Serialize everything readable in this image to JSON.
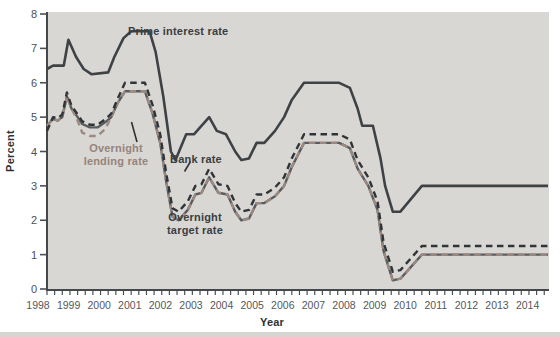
{
  "chart_data": {
    "type": "line",
    "title": "",
    "xlabel": "Year",
    "ylabel": "Percent",
    "xlim": [
      1998,
      2014.4
    ],
    "ylim": [
      0,
      8
    ],
    "y_ticks": [
      0,
      1,
      2,
      3,
      4,
      5,
      6,
      7,
      8
    ],
    "x_ticks": [
      1998,
      1999,
      2000,
      2001,
      2002,
      2003,
      2004,
      2005,
      2006,
      2007,
      2008,
      2009,
      2010,
      2011,
      2012,
      2013,
      2014
    ],
    "x_minor_tick_interval": 0.25,
    "grid": false,
    "legend": "inline-annotations",
    "plot_background": "#d8d7d4",
    "axis_color": "#45484b",
    "series": [
      {
        "name": "Prime interest rate",
        "style": "solid",
        "color": "#3e4245",
        "points": [
          [
            1998.0,
            6.4
          ],
          [
            1998.2,
            6.5
          ],
          [
            1998.55,
            6.5
          ],
          [
            1998.7,
            7.25
          ],
          [
            1998.95,
            6.75
          ],
          [
            1999.2,
            6.4
          ],
          [
            1999.45,
            6.25
          ],
          [
            2000.0,
            6.3
          ],
          [
            2000.2,
            6.75
          ],
          [
            2000.5,
            7.3
          ],
          [
            2000.75,
            7.5
          ],
          [
            2001.35,
            7.5
          ],
          [
            2001.55,
            6.9
          ],
          [
            2001.8,
            5.6
          ],
          [
            2002.05,
            4.0
          ],
          [
            2002.2,
            3.75
          ],
          [
            2002.55,
            4.5
          ],
          [
            2002.8,
            4.5
          ],
          [
            2003.3,
            5.0
          ],
          [
            2003.55,
            4.6
          ],
          [
            2003.85,
            4.5
          ],
          [
            2004.15,
            4.0
          ],
          [
            2004.35,
            3.75
          ],
          [
            2004.6,
            3.8
          ],
          [
            2004.85,
            4.25
          ],
          [
            2005.1,
            4.25
          ],
          [
            2005.45,
            4.6
          ],
          [
            2005.75,
            5.0
          ],
          [
            2006.0,
            5.5
          ],
          [
            2006.4,
            6.0
          ],
          [
            2007.55,
            6.0
          ],
          [
            2007.9,
            5.85
          ],
          [
            2008.15,
            5.25
          ],
          [
            2008.3,
            4.75
          ],
          [
            2008.65,
            4.75
          ],
          [
            2008.9,
            3.8
          ],
          [
            2009.05,
            3.0
          ],
          [
            2009.3,
            2.25
          ],
          [
            2009.55,
            2.25
          ],
          [
            2010.25,
            3.0
          ],
          [
            2014.0,
            3.0
          ]
        ]
      },
      {
        "name": "Bank rate",
        "style": "dashed",
        "color": "#303438",
        "points": [
          [
            1998.0,
            4.6
          ],
          [
            1998.2,
            5.0
          ],
          [
            1998.35,
            4.97
          ],
          [
            1998.5,
            5.08
          ],
          [
            1998.65,
            5.72
          ],
          [
            1998.8,
            5.33
          ],
          [
            1999.0,
            5.08
          ],
          [
            1999.15,
            4.88
          ],
          [
            1999.4,
            4.78
          ],
          [
            1999.65,
            4.78
          ],
          [
            1999.9,
            4.93
          ],
          [
            2000.1,
            5.1
          ],
          [
            2000.3,
            5.52
          ],
          [
            2000.55,
            6.0
          ],
          [
            2001.2,
            6.0
          ],
          [
            2001.45,
            5.35
          ],
          [
            2001.7,
            4.5
          ],
          [
            2001.9,
            3.35
          ],
          [
            2002.1,
            2.35
          ],
          [
            2002.3,
            2.25
          ],
          [
            2002.6,
            2.55
          ],
          [
            2002.85,
            3.0
          ],
          [
            2003.05,
            3.05
          ],
          [
            2003.3,
            3.5
          ],
          [
            2003.6,
            3.05
          ],
          [
            2003.9,
            3.0
          ],
          [
            2004.15,
            2.5
          ],
          [
            2004.35,
            2.25
          ],
          [
            2004.6,
            2.3
          ],
          [
            2004.85,
            2.75
          ],
          [
            2005.1,
            2.75
          ],
          [
            2005.45,
            2.95
          ],
          [
            2005.75,
            3.25
          ],
          [
            2006.0,
            3.8
          ],
          [
            2006.4,
            4.5
          ],
          [
            2007.55,
            4.5
          ],
          [
            2007.9,
            4.35
          ],
          [
            2008.15,
            3.75
          ],
          [
            2008.5,
            3.25
          ],
          [
            2008.8,
            2.55
          ],
          [
            2009.0,
            1.35
          ],
          [
            2009.3,
            0.5
          ],
          [
            2009.55,
            0.55
          ],
          [
            2010.25,
            1.25
          ],
          [
            2014.0,
            1.25
          ]
        ]
      },
      {
        "name": "Overnight lending rate",
        "style": "dashed",
        "color": "#9c8a80",
        "points": [
          [
            1998.0,
            4.75
          ],
          [
            1998.2,
            4.95
          ],
          [
            1998.35,
            4.9
          ],
          [
            1998.5,
            5.0
          ],
          [
            1998.65,
            5.6
          ],
          [
            1998.8,
            5.25
          ],
          [
            1999.0,
            4.9
          ],
          [
            1999.15,
            4.55
          ],
          [
            1999.4,
            4.45
          ],
          [
            1999.65,
            4.45
          ],
          [
            1999.9,
            4.65
          ],
          [
            2000.1,
            5.0
          ],
          [
            2000.3,
            5.4
          ],
          [
            2000.55,
            5.75
          ],
          [
            2001.2,
            5.75
          ],
          [
            2001.45,
            5.1
          ],
          [
            2001.7,
            4.25
          ],
          [
            2001.9,
            3.1
          ],
          [
            2002.1,
            2.1
          ],
          [
            2002.3,
            2.0
          ],
          [
            2002.6,
            2.3
          ],
          [
            2002.85,
            2.75
          ],
          [
            2003.05,
            2.8
          ],
          [
            2003.3,
            3.25
          ],
          [
            2003.6,
            2.8
          ],
          [
            2003.9,
            2.75
          ],
          [
            2004.15,
            2.25
          ],
          [
            2004.35,
            2.0
          ],
          [
            2004.6,
            2.05
          ],
          [
            2004.85,
            2.5
          ],
          [
            2005.1,
            2.5
          ],
          [
            2005.45,
            2.7
          ],
          [
            2005.75,
            3.0
          ],
          [
            2006.0,
            3.55
          ],
          [
            2006.4,
            4.25
          ],
          [
            2007.55,
            4.25
          ],
          [
            2007.9,
            4.1
          ],
          [
            2008.15,
            3.5
          ],
          [
            2008.5,
            3.0
          ],
          [
            2008.8,
            2.3
          ],
          [
            2009.0,
            1.1
          ],
          [
            2009.3,
            0.25
          ],
          [
            2009.55,
            0.3
          ],
          [
            2010.25,
            1.0
          ],
          [
            2014.0,
            1.0
          ]
        ]
      },
      {
        "name": "Overnight target rate",
        "style": "solid",
        "color": "#585c5f",
        "points": [
          [
            1998.0,
            4.75
          ],
          [
            1998.2,
            4.95
          ],
          [
            1998.35,
            4.9
          ],
          [
            1998.5,
            5.0
          ],
          [
            1998.65,
            5.6
          ],
          [
            1998.8,
            5.25
          ],
          [
            1999.0,
            5.0
          ],
          [
            1999.15,
            4.8
          ],
          [
            1999.4,
            4.7
          ],
          [
            1999.65,
            4.7
          ],
          [
            1999.9,
            4.85
          ],
          [
            2000.1,
            5.0
          ],
          [
            2000.3,
            5.4
          ],
          [
            2000.55,
            5.75
          ],
          [
            2001.2,
            5.75
          ],
          [
            2001.45,
            5.1
          ],
          [
            2001.7,
            4.25
          ],
          [
            2001.9,
            3.1
          ],
          [
            2002.1,
            2.1
          ],
          [
            2002.3,
            2.0
          ],
          [
            2002.6,
            2.3
          ],
          [
            2002.85,
            2.75
          ],
          [
            2003.05,
            2.8
          ],
          [
            2003.3,
            3.25
          ],
          [
            2003.6,
            2.8
          ],
          [
            2003.9,
            2.75
          ],
          [
            2004.15,
            2.25
          ],
          [
            2004.35,
            2.0
          ],
          [
            2004.6,
            2.05
          ],
          [
            2004.85,
            2.5
          ],
          [
            2005.1,
            2.5
          ],
          [
            2005.45,
            2.7
          ],
          [
            2005.75,
            3.0
          ],
          [
            2006.0,
            3.55
          ],
          [
            2006.4,
            4.25
          ],
          [
            2007.55,
            4.25
          ],
          [
            2007.9,
            4.1
          ],
          [
            2008.15,
            3.5
          ],
          [
            2008.5,
            3.0
          ],
          [
            2008.8,
            2.3
          ],
          [
            2009.0,
            1.1
          ],
          [
            2009.3,
            0.25
          ],
          [
            2009.55,
            0.3
          ],
          [
            2010.25,
            1.0
          ],
          [
            2014.0,
            1.0
          ]
        ]
      }
    ]
  }
}
